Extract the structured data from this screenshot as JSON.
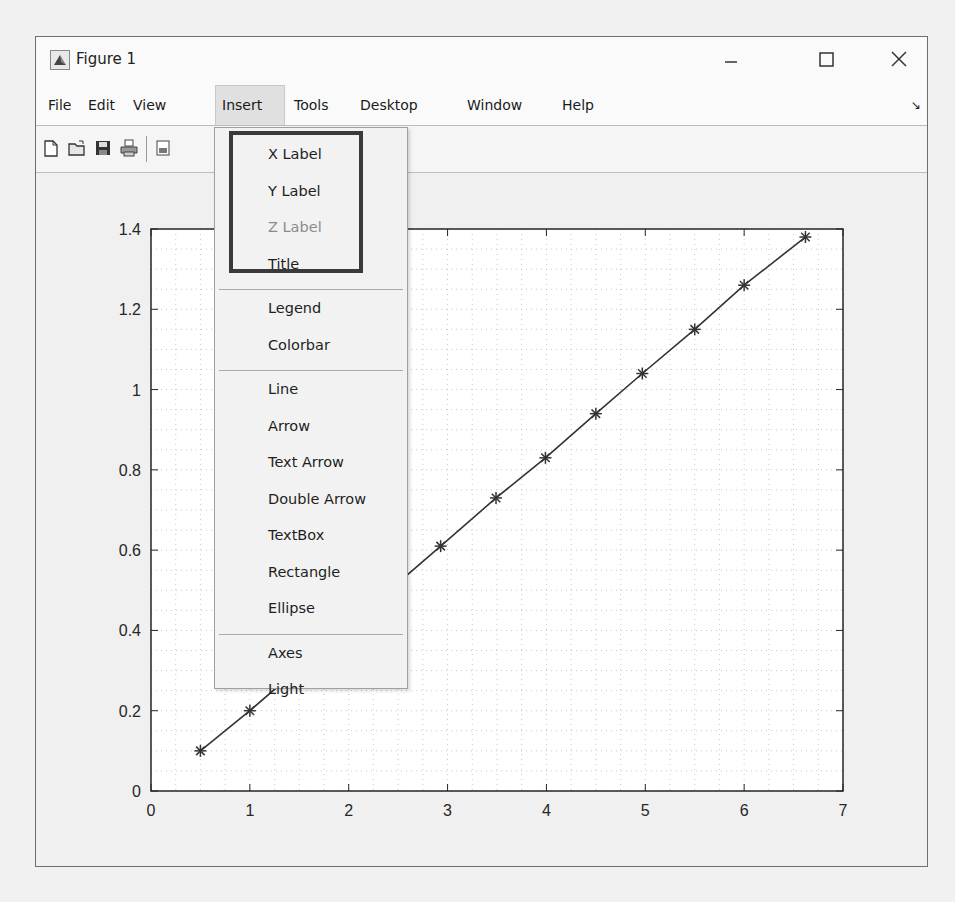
{
  "window": {
    "title": "Figure 1",
    "icon": "matlab-figure-icon",
    "controls": [
      "minimize",
      "maximize",
      "close"
    ]
  },
  "menubar": {
    "items": [
      {
        "label": "File"
      },
      {
        "label": "Edit"
      },
      {
        "label": "View"
      },
      {
        "label": "Insert",
        "active": true
      },
      {
        "label": "Tools"
      },
      {
        "label": "Desktop"
      },
      {
        "label": "Window"
      },
      {
        "label": "Help"
      }
    ],
    "dock_icon": "↘"
  },
  "toolbar": {
    "icons": [
      "new-figure-icon",
      "open-file-icon",
      "save-icon",
      "print-icon",
      "print-preview-icon"
    ]
  },
  "insert_menu": {
    "highlighted_group": [
      "X Label",
      "Y Label",
      "Z Label",
      "Title"
    ],
    "items": [
      {
        "label": "X Label",
        "enabled": true
      },
      {
        "label": "Y Label",
        "enabled": true
      },
      {
        "label": "Z Label",
        "enabled": false
      },
      {
        "label": "Title",
        "enabled": true
      },
      {
        "separator": true
      },
      {
        "label": "Legend",
        "enabled": true
      },
      {
        "label": "Colorbar",
        "enabled": true
      },
      {
        "separator": true
      },
      {
        "label": "Line",
        "enabled": true
      },
      {
        "label": "Arrow",
        "enabled": true
      },
      {
        "label": "Text Arrow",
        "enabled": true
      },
      {
        "label": "Double Arrow",
        "enabled": true
      },
      {
        "label": "TextBox",
        "enabled": true
      },
      {
        "label": "Rectangle",
        "enabled": true
      },
      {
        "label": "Ellipse",
        "enabled": true
      },
      {
        "separator": true
      },
      {
        "label": "Axes",
        "enabled": true
      },
      {
        "label": "Light",
        "enabled": true
      }
    ]
  },
  "chart_data": {
    "type": "line",
    "title": "",
    "xlabel": "",
    "ylabel": "",
    "xlim": [
      0,
      7
    ],
    "ylim": [
      0,
      1.4
    ],
    "xticks": [
      "0",
      "1",
      "2",
      "3",
      "4",
      "5",
      "6",
      "7"
    ],
    "yticks": [
      "0",
      "0.2",
      "0.4",
      "0.6",
      "0.8",
      "1",
      "1.2",
      "1.4"
    ],
    "grid": "minor dotted",
    "marker": "*",
    "line_color": "#333333",
    "series": [
      {
        "name": "data",
        "x": [
          0.5,
          1.0,
          2.93,
          3.49,
          3.99,
          4.5,
          4.97,
          5.5,
          6.0,
          6.62
        ],
        "y": [
          0.1,
          0.2,
          0.61,
          0.73,
          0.83,
          0.94,
          1.04,
          1.15,
          1.26,
          1.38
        ]
      }
    ]
  }
}
